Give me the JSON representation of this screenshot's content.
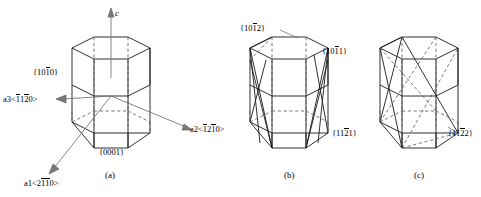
{
  "figure": {
    "type": "crystallography-hexagonal-planes",
    "background_color": "#ffffff",
    "line_color": "#1a1a1a",
    "dashed_color": "#555555",
    "arrow_color": "#666666"
  },
  "panels": [
    {
      "id": "a",
      "caption": "(a)",
      "axes": [
        {
          "name": "c",
          "symbol": "c",
          "index": "",
          "direction": "up"
        },
        {
          "name": "a1",
          "symbol": "a1",
          "index": "<2110>",
          "index_bars": [
            0,
            1,
            1,
            0
          ],
          "direction": "down-left"
        },
        {
          "name": "a2",
          "symbol": "a2",
          "index": "<1210>",
          "index_bars": [
            1,
            0,
            1,
            0
          ],
          "direction": "right"
        },
        {
          "name": "a3",
          "symbol": "a3",
          "index": "<1120>",
          "index_bars": [
            1,
            0,
            1,
            0
          ],
          "direction": "up-left"
        }
      ],
      "planes": [
        {
          "name": "prism-plane",
          "label": "{1010}",
          "bars": [
            0,
            0,
            1,
            0
          ]
        },
        {
          "name": "basal-plane",
          "label": "{0001}",
          "bars": [
            0,
            0,
            0,
            0
          ]
        }
      ]
    },
    {
      "id": "b",
      "caption": "(b)",
      "planes": [
        {
          "name": "pyramidal-1012",
          "label": "{1012}",
          "bars": [
            0,
            0,
            1,
            0
          ],
          "position": "top-left"
        },
        {
          "name": "pyramidal-1011",
          "label": "{1011}",
          "bars": [
            0,
            0,
            1,
            0
          ],
          "position": "right"
        },
        {
          "name": "pyramidal-1121",
          "label": "{1121}",
          "bars": [
            0,
            0,
            1,
            0
          ],
          "position": "bottom-right"
        }
      ]
    },
    {
      "id": "c",
      "caption": "(c)",
      "planes": [
        {
          "name": "pyramidal-1122",
          "label": "{1122}",
          "bars": [
            0,
            0,
            1,
            0
          ],
          "position": "bottom-right"
        }
      ]
    }
  ],
  "labels": {
    "a_c_axis": "c",
    "a_a1_sym": "a1",
    "a_a1_open": "<2",
    "a_a1_bar1": "1",
    "a_a1_bar2": "1",
    "a_a1_close": "0>",
    "a_a2_sym": "a2",
    "a_a2_open": "<",
    "a_a2_bar1": "1",
    "a_a2_mid": "2",
    "a_a2_bar2": "1",
    "a_a2_close": "0>",
    "a_a3_sym": "a3",
    "a_a3_open": "<",
    "a_a3_bar1": "1",
    "a_a3_mid": "1",
    "a_a3_bar2": "2",
    "a_a3_close": "0>",
    "a_prism_open": "{10",
    "a_prism_bar": "1",
    "a_prism_close": "0}",
    "a_basal": "{0001}",
    "a_caption": "(a)",
    "b_p1012_open": "{10",
    "b_p1012_bar": "1",
    "b_p1012_close": "2}",
    "b_p1011_open": "{10",
    "b_p1011_bar": "1",
    "b_p1011_close": "1}",
    "b_p1121_open": "{11",
    "b_p1121_bar": "2",
    "b_p1121_close": "1}",
    "b_caption": "(b)",
    "c_p1122_open": "{11",
    "c_p1122_bar": "2",
    "c_p1122_close": "2}",
    "c_caption": "(c)"
  }
}
